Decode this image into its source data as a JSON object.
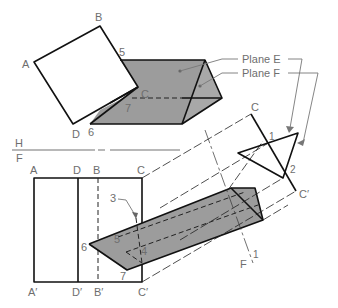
{
  "figure": {
    "colors": {
      "prism_fill": "#9c9c9c",
      "plate_fill_front": "#e8e8e8",
      "label_gray": "#6e6e6e",
      "line": "#111111"
    }
  },
  "top_view": {
    "corner_labels": {
      "A": "A",
      "B": "B",
      "C": "C",
      "D": "D"
    },
    "point_labels": {
      "p5": "5",
      "p6": "6",
      "p7": "7"
    }
  },
  "fold_lines": {
    "hf_top": "H",
    "hf_bottom": "F",
    "f1_left": "F",
    "f1_right": "1"
  },
  "front_view": {
    "top_labels": [
      "A",
      "D",
      "B",
      "C"
    ],
    "bottom_labels": [
      "A′",
      "D′",
      "B′",
      "C′"
    ],
    "point_labels": {
      "p3": "3",
      "p4": "4",
      "p5": "5",
      "p6": "6",
      "p7": "7"
    }
  },
  "auxiliary_view": {
    "edge_labels": {
      "C": "C",
      "Cp": "C′"
    },
    "point_labels": {
      "p1": "1",
      "p2": "2"
    }
  },
  "callouts": {
    "plane_e": "Plane E",
    "plane_f": "Plane F"
  }
}
